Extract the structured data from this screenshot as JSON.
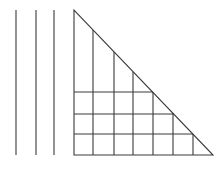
{
  "diagram": {
    "stroke_color": "#3a3a3a",
    "background": "#ffffff",
    "free_vertical_lines": [
      {
        "x": 16,
        "y1": 10,
        "y2": 155
      },
      {
        "x": 36,
        "y1": 10,
        "y2": 155
      },
      {
        "x": 54,
        "y1": 10,
        "y2": 155
      }
    ],
    "triangle": {
      "vertices": [
        [
          74,
          10
        ],
        [
          74,
          155
        ],
        [
          213,
          155
        ]
      ],
      "internal_vertical_lines": [
        {
          "x": 93,
          "y_top": 30
        },
        {
          "x": 114,
          "y_top": 52
        },
        {
          "x": 133,
          "y_top": 72
        },
        {
          "x": 153,
          "y_top": 92
        },
        {
          "x": 173,
          "y_top": 113
        },
        {
          "x": 193,
          "y_top": 134
        }
      ],
      "internal_horizontal_lines": [
        {
          "y": 92,
          "x_right": 153
        },
        {
          "y": 114,
          "x_right": 174
        },
        {
          "y": 134,
          "x_right": 193
        }
      ],
      "bottom_y": 155
    }
  }
}
